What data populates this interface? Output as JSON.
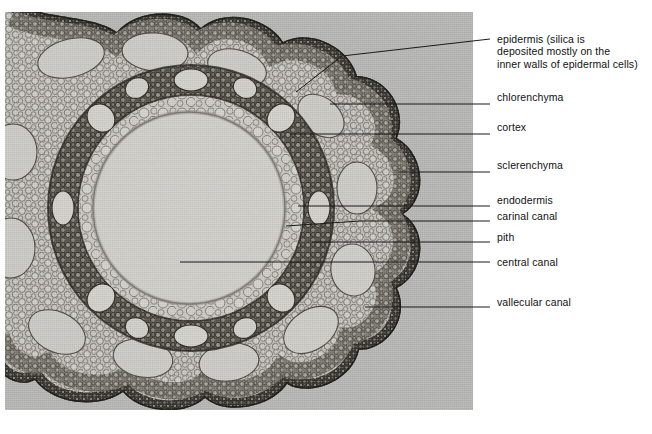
{
  "figure": {
    "specimen": "horsetail stem cross-section light micrograph",
    "panel_background": "#b9b9b7"
  },
  "labels": [
    {
      "id": "epidermis",
      "text": "epidermis (silica is\ndeposited mostly on the\ninner walls of epidermal cells)",
      "top": 33
    },
    {
      "id": "chlorenchyma",
      "text": "chlorenchyma",
      "top": 91
    },
    {
      "id": "cortex",
      "text": "cortex",
      "top": 121
    },
    {
      "id": "sclerenchyma",
      "text": "sclerenchyma",
      "top": 159
    },
    {
      "id": "endodermis",
      "text": "endodermis",
      "top": 194
    },
    {
      "id": "carinal-canal",
      "text": "carinal canal",
      "top": 210
    },
    {
      "id": "pith",
      "text": "pith",
      "top": 231
    },
    {
      "id": "central-canal",
      "text": "central canal",
      "top": 256
    },
    {
      "id": "vallecular-canal",
      "text": "vallecular canal",
      "top": 296
    }
  ]
}
